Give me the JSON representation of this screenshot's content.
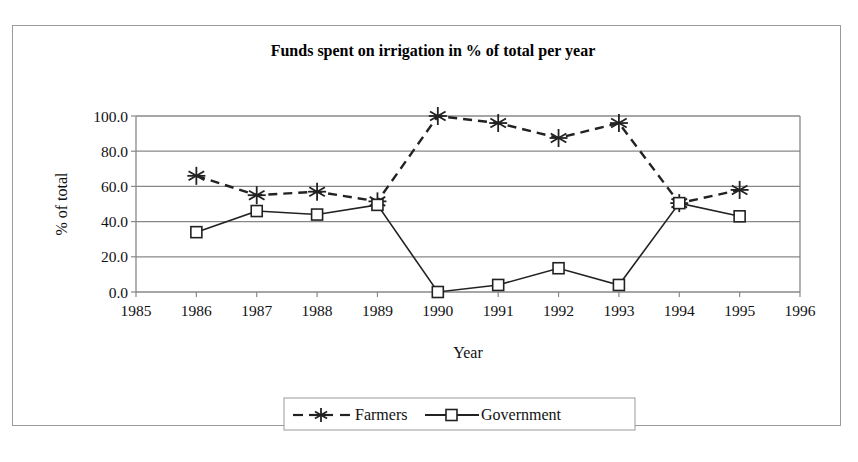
{
  "chart_data": {
    "type": "line",
    "title": "Funds spent on irrigation in % of total per year",
    "xlabel": "Year",
    "ylabel": "% of total",
    "xlim": [
      1985,
      1996
    ],
    "ylim": [
      0,
      100
    ],
    "x_ticks": [
      "1985",
      "1986",
      "1987",
      "1988",
      "1989",
      "1990",
      "1991",
      "1992",
      "1993",
      "1994",
      "1995",
      "1996"
    ],
    "y_ticks": [
      "0.0",
      "20.0",
      "40.0",
      "60.0",
      "80.0",
      "100.0"
    ],
    "grid": "horizontal",
    "legend_position": "bottom",
    "x": [
      1986,
      1987,
      1988,
      1989,
      1990,
      1991,
      1992,
      1993,
      1994,
      1995
    ],
    "series": [
      {
        "name": "Farmers",
        "style": "dashed",
        "marker": "asterisk",
        "values": [
          66.0,
          55.0,
          57.0,
          51.5,
          100.0,
          96.0,
          87.5,
          96.0,
          50.5,
          58.0
        ]
      },
      {
        "name": "Government",
        "style": "solid",
        "marker": "square",
        "values": [
          34.0,
          46.0,
          44.0,
          49.5,
          0.0,
          4.0,
          13.5,
          4.0,
          50.5,
          43.0
        ]
      }
    ]
  },
  "colors": {
    "line": "#222222",
    "grid": "#888888",
    "frame": "#9a9a9a"
  }
}
